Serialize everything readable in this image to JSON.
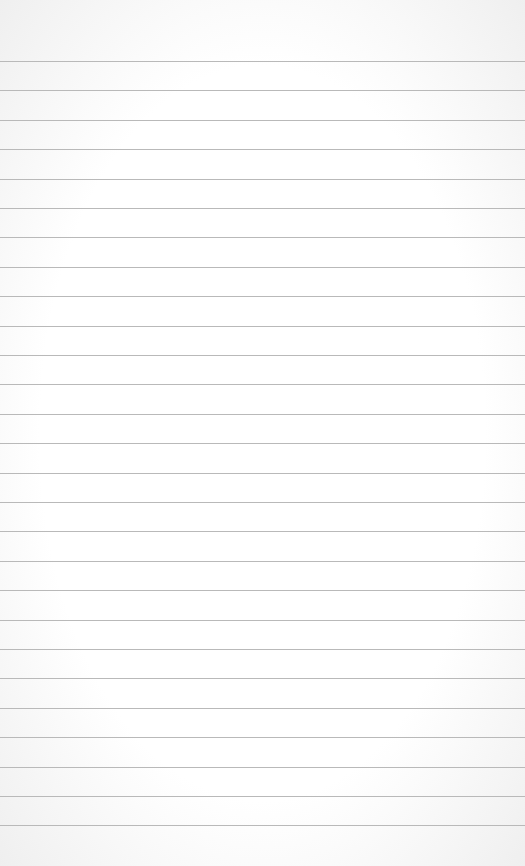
{
  "paper": {
    "type": "lined-note-paper",
    "line_count": 27,
    "first_line_y": 61,
    "line_spacing": 29.4,
    "line_color": "#b9b9b9",
    "background": "#ffffff"
  }
}
